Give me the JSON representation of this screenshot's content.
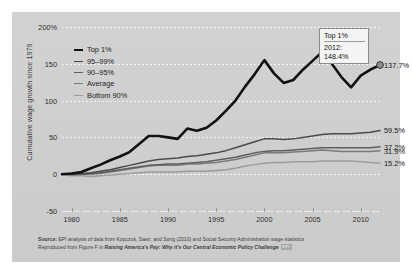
{
  "chart_data": {
    "type": "line",
    "title": "",
    "xlabel": "",
    "ylabel": "Cumulative wage growth since 1979",
    "ylim": [
      -50,
      200
    ],
    "xlim": [
      1979,
      2012
    ],
    "grid": true,
    "legend_position": "top-left",
    "y_ticks": [
      "200%",
      "150",
      "100",
      "50",
      "0",
      "-50"
    ],
    "y_tick_values": [
      200,
      150,
      100,
      50,
      0,
      -50
    ],
    "x_ticks": [
      "1980",
      "1985",
      "1990",
      "1995",
      "2000",
      "2005",
      "2010"
    ],
    "x_tick_values": [
      1980,
      1985,
      1990,
      1995,
      2000,
      2005,
      2010
    ],
    "x": [
      1979,
      1980,
      1981,
      1982,
      1983,
      1984,
      1985,
      1986,
      1987,
      1988,
      1989,
      1990,
      1991,
      1992,
      1993,
      1994,
      1995,
      1996,
      1997,
      1998,
      1999,
      2000,
      2001,
      2002,
      2003,
      2004,
      2005,
      2006,
      2007,
      2008,
      2009,
      2010,
      2011,
      2012
    ],
    "series": [
      {
        "name": "Top 1%",
        "color": "#111111",
        "width": 2.6,
        "end_label": "137.7%",
        "values": [
          0,
          1,
          3,
          8,
          13,
          19,
          24,
          30,
          41,
          52,
          52,
          50,
          48,
          62,
          59,
          63,
          73,
          86,
          100,
          119,
          136,
          155,
          137,
          124,
          128,
          142,
          154,
          166,
          150,
          132,
          118,
          134,
          142,
          148.4
        ]
      },
      {
        "name": "95–99%",
        "color": "#4a4a4a",
        "width": 1.5,
        "end_label": "59.5%",
        "values": [
          0,
          0,
          1,
          2,
          4,
          6,
          9,
          12,
          15,
          18,
          20,
          21,
          22,
          24,
          25,
          27,
          29,
          32,
          36,
          40,
          44,
          48,
          48,
          47,
          48,
          50,
          52,
          54,
          55,
          55,
          55,
          56,
          57,
          59.5
        ]
      },
      {
        "name": "90–95%",
        "color": "#5e5e5e",
        "width": 1.5,
        "end_label": "37.2%",
        "values": [
          0,
          0,
          0,
          1,
          2,
          4,
          6,
          8,
          10,
          12,
          13,
          14,
          14,
          15,
          16,
          17,
          19,
          21,
          23,
          26,
          29,
          31,
          32,
          32,
          33,
          34,
          35,
          36,
          36,
          36,
          36,
          36,
          36,
          37.2
        ]
      },
      {
        "name": "Average",
        "color": "#7a7a7a",
        "width": 1.5,
        "end_label": "31.9%",
        "values": [
          0,
          -1,
          0,
          0,
          1,
          3,
          5,
          7,
          9,
          11,
          12,
          12,
          12,
          14,
          14,
          15,
          16,
          18,
          20,
          23,
          26,
          29,
          29,
          29,
          30,
          31,
          32,
          33,
          32,
          31,
          31,
          31,
          31,
          31.9
        ]
      },
      {
        "name": "Bottom 90%",
        "color": "#9c9c9c",
        "width": 1.5,
        "end_label": "15.2%",
        "values": [
          0,
          -2,
          -2,
          -3,
          -2,
          -1,
          0,
          1,
          2,
          3,
          3,
          3,
          3,
          4,
          4,
          4,
          5,
          6,
          8,
          11,
          13,
          15,
          16,
          16,
          17,
          17,
          17,
          18,
          18,
          18,
          18,
          17,
          16,
          15.2
        ]
      }
    ],
    "tooltip": {
      "title": "Top 1%",
      "year_label": "2012:",
      "value_label": "148.4%",
      "hover_point": {
        "x": 2012,
        "y": 148.4
      }
    }
  },
  "legend": {
    "items": [
      {
        "label": "Top 1%"
      },
      {
        "label": "95–99%"
      },
      {
        "label": "90–95%"
      },
      {
        "label": "Average"
      },
      {
        "label": "Bottom 90%"
      }
    ]
  },
  "footer": {
    "source_bold": "Source:",
    "source_text": " EPI analysis of data from Kopczuk, Saez, and Song (2010) and Social Security Administration wage statistics",
    "repro_prefix": "Reproduced from Figure F in ",
    "repro_title": "Raising America's Pay: Why it's Our Central Economic Policy Challenge",
    "badge": "EPI"
  }
}
